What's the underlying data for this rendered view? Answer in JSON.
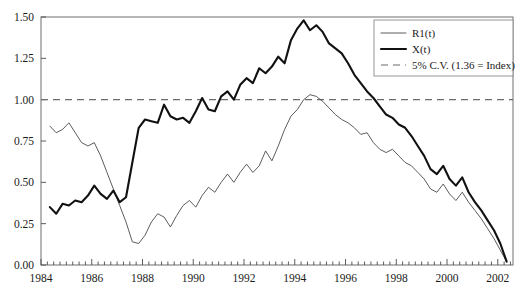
{
  "chart_data": {
    "type": "line",
    "title": "",
    "subtitle": "",
    "xlabel": "",
    "ylabel": "",
    "xlim": [
      1984.0,
      2002.6
    ],
    "ylim": [
      0.0,
      1.5
    ],
    "grid": false,
    "legend_position": "top-right",
    "x_ticks": [
      "1984",
      "1986",
      "1988",
      "1990",
      "1992",
      "1994",
      "1996",
      "1998",
      "2000",
      "2002"
    ],
    "x_tick_values": [
      1984,
      1986,
      1988,
      1990,
      1992,
      1994,
      1996,
      1998,
      2000,
      2002
    ],
    "x_minor_tick_step": 0.25,
    "y_ticks": [
      "0.00",
      "0.25",
      "0.50",
      "0.75",
      "1.00",
      "1.25",
      "1.50"
    ],
    "y_tick_values": [
      0.0,
      0.25,
      0.5,
      0.75,
      1.0,
      1.25,
      1.5
    ],
    "annotations": [
      {
        "name": "critical-value-line",
        "label": "5% C.V. (1.36 = Index)",
        "y": 1.0,
        "style": "dashed"
      }
    ],
    "series": [
      {
        "name": "R1(t)",
        "style": "thin",
        "color": "#4a4a4a",
        "x": [
          1984.35,
          1984.6,
          1984.85,
          1985.1,
          1985.35,
          1985.6,
          1985.85,
          1986.1,
          1986.35,
          1986.6,
          1986.85,
          1987.1,
          1987.35,
          1987.6,
          1987.85,
          1988.1,
          1988.35,
          1988.6,
          1988.85,
          1989.1,
          1989.35,
          1989.6,
          1989.85,
          1990.1,
          1990.35,
          1990.6,
          1990.85,
          1991.1,
          1991.35,
          1991.6,
          1991.85,
          1992.1,
          1992.35,
          1992.6,
          1992.85,
          1993.1,
          1993.35,
          1993.6,
          1993.85,
          1994.1,
          1994.35,
          1994.6,
          1994.85,
          1995.1,
          1995.35,
          1995.6,
          1995.85,
          1996.1,
          1996.35,
          1996.6,
          1996.85,
          1997.1,
          1997.35,
          1997.6,
          1997.85,
          1998.1,
          1998.35,
          1998.6,
          1998.85,
          1999.1,
          1999.35,
          1999.6,
          1999.85,
          2000.1,
          2000.35,
          2000.6,
          2000.85,
          2001.1,
          2001.35,
          2001.6,
          2001.85,
          2002.1,
          2002.35
        ],
        "y": [
          0.84,
          0.8,
          0.82,
          0.86,
          0.8,
          0.74,
          0.72,
          0.74,
          0.66,
          0.56,
          0.46,
          0.36,
          0.26,
          0.14,
          0.13,
          0.18,
          0.26,
          0.31,
          0.29,
          0.23,
          0.3,
          0.36,
          0.39,
          0.35,
          0.42,
          0.47,
          0.44,
          0.5,
          0.55,
          0.5,
          0.56,
          0.61,
          0.56,
          0.6,
          0.69,
          0.63,
          0.72,
          0.82,
          0.9,
          0.94,
          1.0,
          1.03,
          1.02,
          0.99,
          0.95,
          0.91,
          0.88,
          0.86,
          0.83,
          0.79,
          0.8,
          0.74,
          0.7,
          0.68,
          0.7,
          0.66,
          0.62,
          0.6,
          0.56,
          0.52,
          0.46,
          0.44,
          0.49,
          0.43,
          0.39,
          0.44,
          0.38,
          0.33,
          0.28,
          0.22,
          0.16,
          0.09,
          0.02
        ]
      },
      {
        "name": "X(t)",
        "style": "thick",
        "color": "#111111",
        "x": [
          1984.35,
          1984.6,
          1984.85,
          1985.1,
          1985.35,
          1985.6,
          1985.85,
          1986.1,
          1986.35,
          1986.6,
          1986.85,
          1987.1,
          1987.35,
          1987.6,
          1987.85,
          1988.1,
          1988.35,
          1988.6,
          1988.85,
          1989.1,
          1989.35,
          1989.6,
          1989.85,
          1990.1,
          1990.35,
          1990.6,
          1990.85,
          1991.1,
          1991.35,
          1991.6,
          1991.85,
          1992.1,
          1992.35,
          1992.6,
          1992.85,
          1993.1,
          1993.35,
          1993.6,
          1993.85,
          1994.1,
          1994.35,
          1994.6,
          1994.85,
          1995.1,
          1995.35,
          1995.6,
          1995.85,
          1996.1,
          1996.35,
          1996.6,
          1996.85,
          1997.1,
          1997.35,
          1997.6,
          1997.85,
          1998.1,
          1998.35,
          1998.6,
          1998.85,
          1999.1,
          1999.35,
          1999.6,
          1999.85,
          2000.1,
          2000.35,
          2000.6,
          2000.85,
          2001.1,
          2001.35,
          2001.6,
          2001.85,
          2002.1,
          2002.35
        ],
        "y": [
          0.35,
          0.31,
          0.37,
          0.36,
          0.39,
          0.38,
          0.42,
          0.48,
          0.43,
          0.4,
          0.45,
          0.38,
          0.41,
          0.62,
          0.83,
          0.88,
          0.87,
          0.86,
          0.97,
          0.9,
          0.88,
          0.89,
          0.86,
          0.93,
          1.01,
          0.94,
          0.93,
          1.02,
          1.05,
          1.0,
          1.09,
          1.13,
          1.1,
          1.19,
          1.16,
          1.2,
          1.26,
          1.22,
          1.36,
          1.43,
          1.48,
          1.42,
          1.45,
          1.41,
          1.34,
          1.31,
          1.28,
          1.22,
          1.15,
          1.1,
          1.05,
          1.01,
          0.96,
          0.91,
          0.89,
          0.85,
          0.83,
          0.78,
          0.72,
          0.66,
          0.58,
          0.55,
          0.6,
          0.52,
          0.48,
          0.53,
          0.44,
          0.38,
          0.33,
          0.27,
          0.21,
          0.13,
          0.02
        ]
      }
    ],
    "legend": [
      {
        "label": "R1(t)",
        "style": "thin"
      },
      {
        "label": "X(t)",
        "style": "thick"
      },
      {
        "label": "5% C.V. (1.36 = Index)",
        "style": "dashed"
      }
    ]
  }
}
